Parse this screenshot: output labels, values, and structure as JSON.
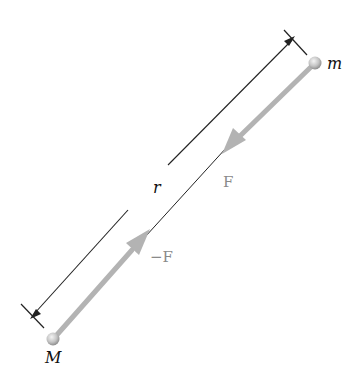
{
  "diagram": {
    "labels": {
      "mass_small": "m",
      "mass_large": "M",
      "distance": "r",
      "force_on_m": "F",
      "force_on_M": "−F"
    },
    "colors": {
      "rod": "#b3b3b3",
      "ball": "#c8c8c8",
      "dimension_line": "#222222",
      "force_label": "#8a8a8a",
      "text": "#111111"
    }
  }
}
